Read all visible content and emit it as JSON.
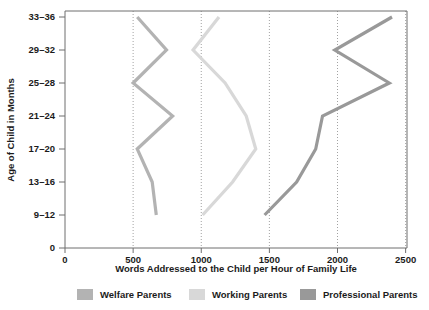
{
  "chart_data": {
    "type": "line",
    "title": "",
    "xlabel": "Words Addressed to the Child per Hour of Family Life",
    "ylabel": "Age of Child in Months",
    "orientation": "horizontal-value-axis",
    "grid": true,
    "legend_position": "bottom",
    "xlim": [
      0,
      2510
    ],
    "xticks": [
      0,
      500,
      1000,
      1500,
      2000,
      2500
    ],
    "xtick_labels": [
      "0",
      "500",
      "1000",
      "1500",
      "2000",
      "2500"
    ],
    "ytick_labels": [
      "0",
      "9–12",
      "13–16",
      "17–20",
      "21–24",
      "25–28",
      "29–32",
      "33–36"
    ],
    "categories": [
      "9–12",
      "13–16",
      "17–20",
      "21–24",
      "25–28",
      "29–32",
      "33–36"
    ],
    "series": [
      {
        "name": "Welfare Parents",
        "color": "#b3b3b3",
        "values": [
          670,
          640,
          530,
          790,
          500,
          745,
          530
        ]
      },
      {
        "name": "Working Parents",
        "color": "#d8d8d8",
        "values": [
          1010,
          1230,
          1400,
          1330,
          1175,
          940,
          1130
        ]
      },
      {
        "name": "Professional Parents",
        "color": "#999999",
        "values": [
          1465,
          1700,
          1840,
          1890,
          2380,
          1980,
          2400
        ]
      }
    ]
  },
  "legend": {
    "items": [
      {
        "label": "Welfare Parents",
        "color": "#b3b3b3"
      },
      {
        "label": "Working Parents",
        "color": "#d8d8d8"
      },
      {
        "label": "Professional Parents",
        "color": "#999999"
      }
    ]
  },
  "axes": {
    "x_title": "Words Addressed to the Child per Hour of Family Life",
    "y_title": "Age of Child in Months"
  }
}
